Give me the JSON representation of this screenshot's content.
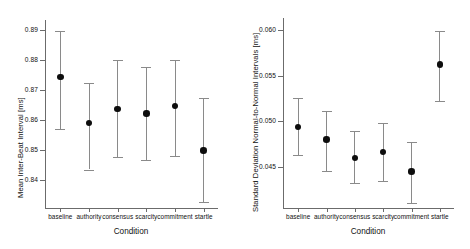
{
  "chart_data": [
    {
      "type": "scatter",
      "panel": "left",
      "title": "",
      "xlabel": "Condition",
      "ylabel": "Mean Inter-Beat Interval [ms]",
      "categories": [
        "baseline",
        "authority",
        "consensus",
        "scarcity",
        "commitment",
        "startle"
      ],
      "values": [
        0.8745,
        0.8589,
        0.8636,
        0.8622,
        0.8647,
        0.8498
      ],
      "err_low": [
        0.8571,
        0.8434,
        0.8476,
        0.8466,
        0.848,
        0.8324
      ],
      "err_high": [
        0.8897,
        0.8725,
        0.8801,
        0.8777,
        0.88,
        0.8672
      ],
      "yticks": [
        "0.84",
        "0.85",
        "0.86",
        "0.87",
        "0.88",
        "0.89"
      ],
      "ytickvalues": [
        0.84,
        0.85,
        0.86,
        0.87,
        0.88,
        0.89
      ],
      "ylim": [
        0.8305,
        0.8935
      ],
      "grid": false,
      "legend": "none"
    },
    {
      "type": "scatter",
      "panel": "right",
      "title": "",
      "xlabel": "Condition",
      "ylabel": "Standard Deviation Normal-to-Normal Intervals [ms]",
      "categories": [
        "baseline",
        "authority",
        "consensus",
        "scarcity",
        "commitment",
        "startle"
      ],
      "values": [
        0.0494,
        0.048,
        0.046,
        0.0466,
        0.0445,
        0.0562
      ],
      "err_low": [
        0.0463,
        0.0445,
        0.0432,
        0.0435,
        0.0411,
        0.0522
      ],
      "err_high": [
        0.0525,
        0.0511,
        0.0489,
        0.0498,
        0.0477,
        0.0599
      ],
      "yticks": [
        "0.045",
        "0.050",
        "0.055",
        "0.060"
      ],
      "ytickvalues": [
        0.045,
        0.05,
        0.055,
        0.06
      ],
      "ylim": [
        0.0405,
        0.0613
      ],
      "grid": false,
      "legend": "none"
    }
  ],
  "style": {
    "point_color": "#0d0d0d",
    "errorbar_color": "#8a8a8a",
    "axis_color": "#6b6b6b",
    "background": "#ffffff"
  }
}
